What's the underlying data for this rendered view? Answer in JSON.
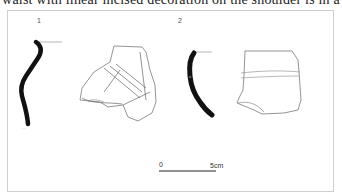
{
  "page": {
    "top_text": "waist with linear incised decoration on the shoulder is in a"
  },
  "figure": {
    "items": [
      {
        "number": "1",
        "description": "rim sherd profile and exterior drawing with incised lines"
      },
      {
        "number": "2",
        "description": "rim sherd profile and exterior drawing with horizontal band"
      }
    ],
    "scale_bar": {
      "start_label": "0",
      "end_label": "5cm"
    }
  }
}
